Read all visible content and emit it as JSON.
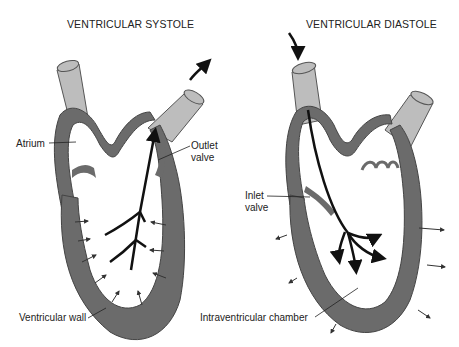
{
  "panels": {
    "systole": {
      "title": "VENTRICULAR SYSTOLE",
      "labels": {
        "atrium": "Atrium",
        "outlet_valve_line1": "Outlet",
        "outlet_valve_line2": "valve",
        "ventricular_wall": "Ventricular wall"
      }
    },
    "diastole": {
      "title": "VENTRICULAR DIASTOLE",
      "labels": {
        "inlet_valve_line1": "Inlet",
        "inlet_valve_line2": "valve",
        "intraventricular_chamber": "Intraventricular chamber"
      }
    }
  },
  "colors": {
    "wall": "#6b6b6b",
    "vessel": "#bdbdbd",
    "vessel_outline": "#555555",
    "arrow": "#111111",
    "background": "#ffffff"
  }
}
